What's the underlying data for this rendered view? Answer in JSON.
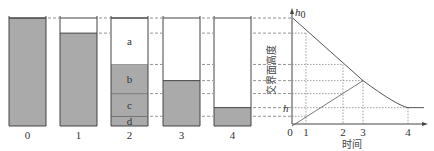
{
  "figure": {
    "cylinders": [
      {
        "label": "0",
        "layers": [
          {
            "name": "",
            "from": 0.0,
            "to": 1.0,
            "fill": "#aaaaaa"
          }
        ]
      },
      {
        "label": "1",
        "layers": [
          {
            "name": "",
            "from": 0.0,
            "to": 0.86,
            "fill": "#aaaaaa"
          }
        ]
      },
      {
        "label": "2",
        "layers": [
          {
            "name": "d",
            "from": 0.0,
            "to": 0.09,
            "fill": "#aaaaaa"
          },
          {
            "name": "c",
            "from": 0.09,
            "to": 0.3,
            "fill": "#aaaaaa"
          },
          {
            "name": "b",
            "from": 0.3,
            "to": 0.57,
            "fill": "#aaaaaa"
          },
          {
            "name": "a",
            "from": 0.57,
            "to": 1.0,
            "fill": "#ffffff"
          }
        ]
      },
      {
        "label": "3",
        "layers": [
          {
            "name": "",
            "from": 0.0,
            "to": 0.42,
            "fill": "#aaaaaa"
          }
        ]
      },
      {
        "label": "4",
        "layers": [
          {
            "name": "",
            "from": 0.0,
            "to": 0.17,
            "fill": "#aaaaaa"
          }
        ]
      }
    ],
    "guide_levels": [
      1.0,
      0.86,
      0.57,
      0.42,
      0.3,
      0.17,
      0.09
    ]
  },
  "chart_data": {
    "type": "line",
    "xlabel": "时间",
    "ylabel": "交界面高度",
    "y_top_label": "h0",
    "y_top_label_main": "h",
    "y_top_label_sub": "0",
    "h_label": "h",
    "origin_label": "0",
    "x_ticks": [
      "1",
      "2",
      "3",
      "4"
    ],
    "x_tick_values": [
      1,
      2,
      3,
      4
    ],
    "xlim": [
      0,
      4.9
    ],
    "ylim": [
      0,
      1.05
    ],
    "series": [
      {
        "name": "interface-curve",
        "points": [
          [
            0.05,
            1.0
          ],
          [
            1,
            0.86
          ],
          [
            2,
            0.57
          ],
          [
            3,
            0.42
          ],
          [
            3.5,
            0.28
          ],
          [
            4,
            0.17
          ],
          [
            4.8,
            0.17
          ]
        ]
      },
      {
        "name": "origin-line",
        "points": [
          [
            0,
            0
          ],
          [
            1,
            0.09
          ],
          [
            2,
            0.3
          ],
          [
            3,
            0.42
          ]
        ]
      }
    ],
    "guide_levels": [
      1.0,
      0.86,
      0.57,
      0.42,
      0.3,
      0.17,
      0.09
    ],
    "h_level": 0.17,
    "grid": false,
    "line_color": "#555555",
    "guide_color": "#777777"
  }
}
